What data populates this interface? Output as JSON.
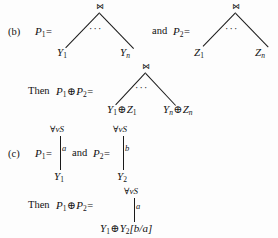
{
  "page": {
    "background": "#fdfdfd",
    "ink": "#111111"
  },
  "sections": {
    "b": {
      "marker": "(b)",
      "lhs_label": "P",
      "lhs_sub": "1",
      "equals": "=",
      "conjunction": "and",
      "rhs_label": "P",
      "rhs_sub": "2",
      "then_prefix": "Then",
      "tree_left": {
        "root_symbol": "⋈",
        "ellipsis": "···",
        "leaf_left": "Y",
        "leaf_left_sub": "1",
        "leaf_right": "Y",
        "leaf_right_sub": "n"
      },
      "tree_right": {
        "root_symbol": "⋈",
        "ellipsis": "···",
        "leaf_left": "Z",
        "leaf_left_sub": "1",
        "leaf_right": "Z",
        "leaf_right_sub": "n"
      },
      "tree_sum": {
        "root_symbol": "⋈",
        "ellipsis": "···",
        "leaf_left": "Y",
        "leaf_left_sub": "1",
        "leaf_left_op": "⊕",
        "leaf_left_b": "Z",
        "leaf_left_b_sub": "1",
        "leaf_right": "Y",
        "leaf_right_sub": "n",
        "leaf_right_op": "⊕",
        "leaf_right_b": "Z",
        "leaf_right_b_sub": "n"
      },
      "oplus": "⊕"
    },
    "c": {
      "marker": "(c)",
      "lhs_label": "P",
      "lhs_sub": "1",
      "equals": "=",
      "conjunction": "and",
      "rhs_label": "P",
      "rhs_sub": "2",
      "then_prefix": "Then",
      "oplus": "⊕",
      "tree_left": {
        "root_quantifier": "∀vS",
        "quant_forall": "∀",
        "quant_var": "v",
        "quant_set": "S",
        "edge_label": "a",
        "leaf": "Y",
        "leaf_sub": "1"
      },
      "tree_right": {
        "root_quantifier": "∀vS",
        "quant_forall": "∀",
        "quant_var": "v",
        "quant_set": "S",
        "edge_label": "b",
        "leaf": "Y",
        "leaf_sub": "2"
      },
      "tree_sum": {
        "root_quantifier": "∀vS",
        "quant_forall": "∀",
        "quant_var": "v",
        "quant_set": "S",
        "edge_label": "a",
        "leaf_a": "Y",
        "leaf_a_sub": "1",
        "leaf_op": "⊕",
        "leaf_b": "Y",
        "leaf_b_sub": "2",
        "leaf_subst": "[b/a]"
      }
    }
  }
}
